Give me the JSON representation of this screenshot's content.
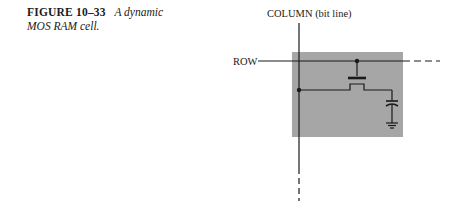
{
  "caption": {
    "figure_number": "FIGURE 10–33",
    "title_line1": "A dynamic",
    "title_line2": "MOS RAM cell."
  },
  "diagram": {
    "column_label": "COLUMN (bit line)",
    "row_label": "ROW",
    "cell_fill_color": "#a6a6a6",
    "line_color": "#1a1a1a",
    "components": [
      "row-line",
      "column-line",
      "mos-transistor",
      "storage-capacitor",
      "ground"
    ]
  }
}
